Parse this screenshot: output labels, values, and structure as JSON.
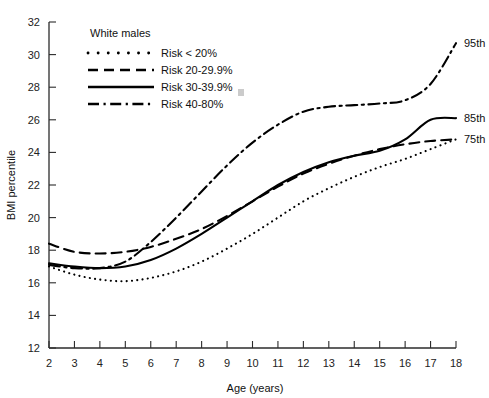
{
  "chart_data": {
    "type": "line",
    "title": "",
    "xlabel": "Age (years)",
    "ylabel": "BMI percentile",
    "xlim": [
      2,
      18
    ],
    "ylim": [
      12,
      32
    ],
    "xticks": [
      2,
      3,
      4,
      5,
      6,
      7,
      8,
      9,
      10,
      11,
      12,
      13,
      14,
      15,
      16,
      17,
      18
    ],
    "yticks": [
      12,
      14,
      16,
      18,
      20,
      22,
      24,
      26,
      28,
      30,
      32
    ],
    "grid": false,
    "legend_position": "top-left",
    "legend_title": "White males",
    "x": [
      2,
      3,
      4,
      5,
      6,
      7,
      8,
      9,
      10,
      11,
      12,
      13,
      14,
      15,
      16,
      17,
      18
    ],
    "series": [
      {
        "name": "Risk < 20%",
        "style": "dotted",
        "values": [
          17.0,
          16.5,
          16.2,
          16.1,
          16.3,
          16.7,
          17.3,
          18.1,
          19.0,
          20.0,
          21.0,
          21.8,
          22.5,
          23.1,
          23.6,
          24.2,
          24.8
        ]
      },
      {
        "name": "Risk 20-29.9%",
        "style": "dashed",
        "values": [
          18.4,
          17.9,
          17.8,
          17.9,
          18.2,
          18.7,
          19.3,
          20.1,
          21.0,
          21.9,
          22.7,
          23.3,
          23.8,
          24.2,
          24.5,
          24.7,
          24.8
        ]
      },
      {
        "name": "Risk 30-39.9%",
        "style": "solid",
        "values": [
          17.2,
          17.0,
          16.9,
          17.0,
          17.4,
          18.1,
          19.0,
          20.0,
          21.0,
          22.0,
          22.8,
          23.4,
          23.8,
          24.1,
          24.8,
          26.0,
          26.1
        ]
      },
      {
        "name": "Risk 40-80%",
        "style": "dash-dot",
        "values": [
          17.1,
          16.9,
          16.9,
          17.3,
          18.5,
          20.0,
          21.6,
          23.2,
          24.6,
          25.7,
          26.5,
          26.8,
          26.9,
          27.0,
          27.2,
          28.2,
          30.7
        ]
      }
    ],
    "annotations": [
      {
        "label": "95th",
        "x": 18,
        "y": 30.7
      },
      {
        "label": "85th",
        "x": 18,
        "y": 26.1
      },
      {
        "label": "75th",
        "x": 18,
        "y": 24.8
      }
    ]
  },
  "legend": {
    "title": "White males",
    "items": [
      {
        "label": "Risk < 20%",
        "style": "dotted"
      },
      {
        "label": "Risk 20-29.9%",
        "style": "dashed"
      },
      {
        "label": "Risk 30-39.9%",
        "style": "solid"
      },
      {
        "label": "Risk 40-80%",
        "style": "dash-dot"
      }
    ]
  },
  "axes": {
    "x_title": "Age (years)",
    "y_title": "BMI percentile"
  }
}
